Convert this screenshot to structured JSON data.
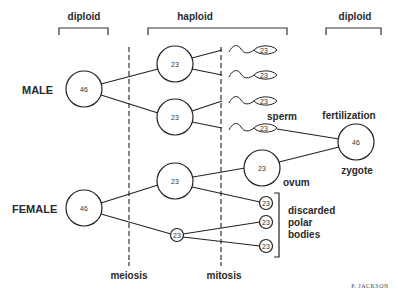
{
  "headers": {
    "left": "diploid",
    "middle": "haploid",
    "right": "diploid"
  },
  "sex_labels": {
    "male": "MALE",
    "female": "FEMALE"
  },
  "cells": {
    "male_parent": "46",
    "male_meiosis_1": "23",
    "male_meiosis_2": "23",
    "female_parent": "46",
    "female_meiosis_1": "23",
    "female_meiosis_polar": "23",
    "ovum": "23",
    "zygote": "46"
  },
  "sperm": [
    "23",
    "23",
    "23",
    "23"
  ],
  "polar_bodies": [
    "23",
    "23",
    "23"
  ],
  "annotations": {
    "sperm": "sperm",
    "fertilization": "fertilization",
    "zygote": "zygote",
    "ovum": "ovum",
    "discarded_line1": "discarded",
    "discarded_line2": "polar",
    "discarded_line3": "bodies",
    "meiosis": "meiosis",
    "mitosis": "mitosis"
  },
  "credit": "P. JACKSON"
}
